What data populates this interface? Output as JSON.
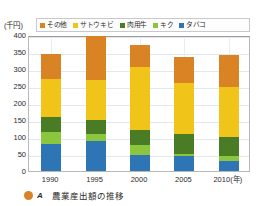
{
  "unit_label": "(千円)",
  "caption": {
    "marker": "filled-circle",
    "letter": "A",
    "text": "農業産出額の推移"
  },
  "legend": {
    "position": "top",
    "items": [
      {
        "label": "その他",
        "color": "#d98324"
      },
      {
        "label": "サトウキビ",
        "color": "#f0c419"
      },
      {
        "label": "肉用牛",
        "color": "#4a7c25"
      },
      {
        "label": "キク",
        "color": "#8cc63f"
      },
      {
        "label": "タバコ",
        "color": "#2e75b6"
      }
    ]
  },
  "chart_data": {
    "type": "bar",
    "stacked": true,
    "title": "農業産出額の推移",
    "xlabel": "(年)",
    "ylabel": "(千円)",
    "ylim": [
      0,
      400
    ],
    "ytick_step": 50,
    "yticks": [
      400,
      350,
      300,
      250,
      200,
      150,
      100,
      50,
      0
    ],
    "ytick_labels": [
      "400",
      "350",
      "300",
      "250",
      "200",
      "150",
      "100",
      "50",
      "0"
    ],
    "grid": true,
    "categories": [
      "1990",
      "1995",
      "2000",
      "2005",
      "2010"
    ],
    "xtick_labels": [
      "1990",
      "1995",
      "2000",
      "2005",
      "2010(年)"
    ],
    "stack_order_bottom_to_top": [
      "サトウキビ",
      "キク",
      "肉用牛",
      "タバコ",
      "その他"
    ],
    "series": [
      {
        "name": "サトウキビ",
        "color": "#2e75b6",
        "values": [
          78,
          88,
          48,
          44,
          30
        ]
      },
      {
        "name": "キク",
        "color": "#8cc63f",
        "values": [
          38,
          20,
          28,
          6,
          14
        ]
      },
      {
        "name": "肉用牛",
        "color": "#4a7c25",
        "values": [
          44,
          42,
          44,
          60,
          56
        ]
      },
      {
        "name": "タバコ",
        "color": "#f0c419",
        "values": [
          110,
          118,
          185,
          148,
          148
        ]
      },
      {
        "name": "その他",
        "color": "#d98324",
        "values": [
          73,
          129,
          65,
          78,
          93
        ]
      }
    ],
    "totals": [
      343,
      397,
      370,
      336,
      341
    ]
  }
}
